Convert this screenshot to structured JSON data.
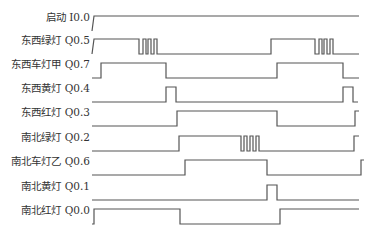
{
  "diagram": {
    "line_color": "#555555",
    "text_color": "#333333",
    "signals": [
      {
        "label": "启动 I0.0",
        "label_y": 17,
        "high_y": 16,
        "low_y": 31,
        "waveform": [
          [
            92,
            0
          ],
          [
            94,
            1
          ],
          [
            359,
            1
          ]
        ]
      },
      {
        "label": "东西绿灯 Q0.5",
        "label_y": 40,
        "high_y": 39,
        "low_y": 54,
        "waveform": [
          [
            92,
            0
          ],
          [
            94,
            1
          ],
          [
            139,
            1
          ],
          [
            139,
            0
          ],
          [
            143,
            0
          ],
          [
            143,
            1
          ],
          [
            146,
            1
          ],
          [
            146,
            0
          ],
          [
            148,
            0
          ],
          [
            148,
            1
          ],
          [
            151,
            1
          ],
          [
            151,
            0
          ],
          [
            154,
            0
          ],
          [
            154,
            1
          ],
          [
            157,
            1
          ],
          [
            157,
            0
          ],
          [
            271,
            0
          ],
          [
            271,
            1
          ],
          [
            315,
            1
          ],
          [
            315,
            0
          ],
          [
            319,
            0
          ],
          [
            319,
            1
          ],
          [
            322,
            1
          ],
          [
            322,
            0
          ],
          [
            324,
            0
          ],
          [
            324,
            1
          ],
          [
            327,
            1
          ],
          [
            327,
            0
          ],
          [
            330,
            0
          ],
          [
            330,
            1
          ],
          [
            333,
            1
          ],
          [
            333,
            0
          ],
          [
            359,
            0
          ]
        ]
      },
      {
        "label": "东西车灯甲 Q0.7",
        "label_y": 64,
        "high_y": 63,
        "low_y": 78,
        "waveform": [
          [
            92,
            0
          ],
          [
            101,
            0
          ],
          [
            101,
            1
          ],
          [
            166,
            1
          ],
          [
            166,
            0
          ],
          [
            277,
            0
          ],
          [
            277,
            1
          ],
          [
            343,
            1
          ],
          [
            343,
            0
          ],
          [
            359,
            0
          ]
        ]
      },
      {
        "label": "东西黄灯 Q0.4",
        "label_y": 88,
        "high_y": 87,
        "low_y": 102,
        "waveform": [
          [
            92,
            0
          ],
          [
            166,
            0
          ],
          [
            166,
            1
          ],
          [
            176,
            1
          ],
          [
            176,
            0
          ],
          [
            343,
            0
          ],
          [
            343,
            1
          ],
          [
            353,
            1
          ],
          [
            353,
            0
          ],
          [
            358,
            0
          ]
        ]
      },
      {
        "label": "东西红灯 Q0.3",
        "label_y": 112,
        "high_y": 111,
        "low_y": 126,
        "waveform": [
          [
            92,
            0
          ],
          [
            177,
            0
          ],
          [
            177,
            1
          ],
          [
            277,
            1
          ],
          [
            277,
            0
          ],
          [
            355,
            0
          ],
          [
            355,
            1
          ],
          [
            359,
            1
          ]
        ]
      },
      {
        "label": "南北绿灯 Q0.2",
        "label_y": 137,
        "high_y": 136,
        "low_y": 151,
        "waveform": [
          [
            92,
            0
          ],
          [
            179,
            0
          ],
          [
            179,
            1
          ],
          [
            241,
            1
          ],
          [
            241,
            0
          ],
          [
            244,
            0
          ],
          [
            244,
            1
          ],
          [
            247,
            1
          ],
          [
            247,
            0
          ],
          [
            250,
            0
          ],
          [
            250,
            1
          ],
          [
            253,
            1
          ],
          [
            253,
            0
          ],
          [
            256,
            0
          ],
          [
            256,
            1
          ],
          [
            259,
            1
          ],
          [
            259,
            0
          ],
          [
            354,
            0
          ],
          [
            354,
            1
          ],
          [
            359,
            1
          ]
        ]
      },
      {
        "label": "南北车灯乙 Q0.6",
        "label_y": 161,
        "high_y": 160,
        "low_y": 175,
        "waveform": [
          [
            92,
            0
          ],
          [
            185,
            0
          ],
          [
            185,
            1
          ],
          [
            267,
            1
          ],
          [
            267,
            0
          ],
          [
            361,
            0
          ],
          [
            361,
            1
          ],
          [
            364,
            1
          ]
        ]
      },
      {
        "label": "南北黄灯 Q0.1",
        "label_y": 186,
        "high_y": 185,
        "low_y": 200,
        "waveform": [
          [
            92,
            0
          ],
          [
            267,
            0
          ],
          [
            267,
            1
          ],
          [
            277,
            1
          ],
          [
            277,
            0
          ],
          [
            359,
            0
          ]
        ]
      },
      {
        "label": "南北红灯 Q0.0",
        "label_y": 210,
        "high_y": 209,
        "low_y": 224,
        "waveform": [
          [
            92,
            0
          ],
          [
            94,
            0
          ],
          [
            94,
            1
          ],
          [
            180,
            1
          ],
          [
            180,
            0
          ],
          [
            280,
            0
          ],
          [
            280,
            1
          ],
          [
            359,
            1
          ]
        ]
      }
    ]
  }
}
